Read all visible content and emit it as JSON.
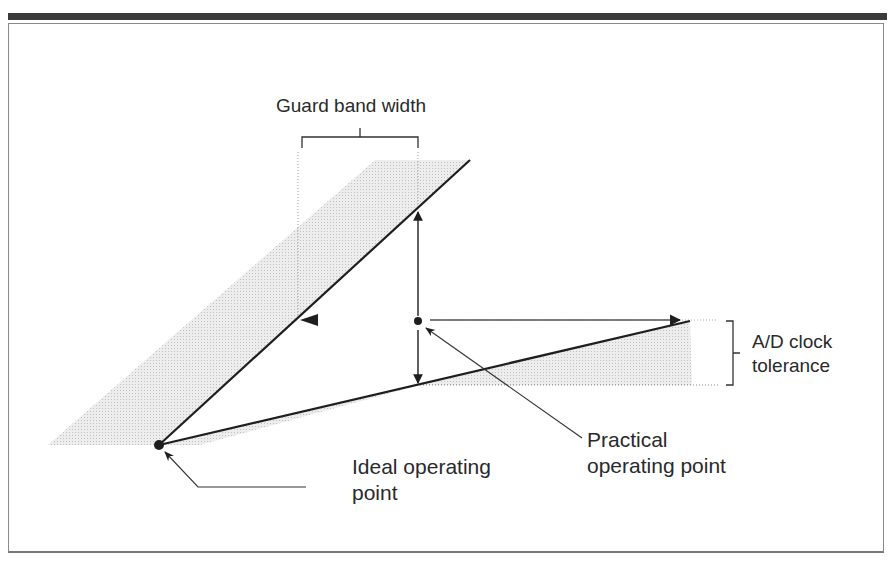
{
  "figure": {
    "labels": {
      "guard_band_width": "Guard band width",
      "ad_clock_tolerance_line1": "A/D clock",
      "ad_clock_tolerance_line2": "tolerance",
      "practical_line1": "Practical",
      "practical_line2": "operating point",
      "ideal_line1": "Ideal operating",
      "ideal_line2": "point"
    },
    "colors": {
      "line": "#1e1e1e",
      "shade": "#e2e2e2",
      "dotted": "#9a9a9a",
      "frame": "#8a8a8a",
      "topbar": "#3a3a3a",
      "text": "#2a2a2a"
    },
    "points": {
      "ideal_operating_point": [
        159,
        445
      ],
      "practical_operating_point": [
        418,
        320
      ]
    }
  }
}
